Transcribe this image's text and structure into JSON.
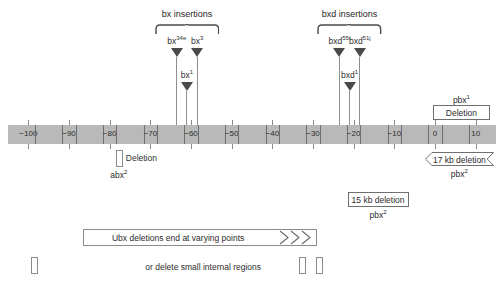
{
  "figure": {
    "type": "genomic-map-diagram",
    "axis": {
      "label_unit": "kb",
      "min": -105,
      "max": 15,
      "ticks": [
        -100,
        -90,
        -80,
        -70,
        -60,
        -50,
        -40,
        -30,
        -20,
        -10,
        0,
        10
      ],
      "tick_labels": [
        "−100",
        "−90",
        "−80",
        "−70",
        "−60",
        "−50",
        "−40",
        "−30",
        "−20",
        "−10",
        "0",
        "10"
      ],
      "bar_color": "#b9b9b9",
      "tick_color": "#6e6e6e"
    },
    "groups": [
      {
        "id": "bx-insertions",
        "title": "bx insertions",
        "brace_center_kb": -61,
        "brace_left_kb": -66,
        "brace_right_kb": -56
      },
      {
        "id": "bxd-insertions",
        "title": "bxd insertions",
        "brace_center_kb": -21,
        "brace_left_kb": -26,
        "brace_right_kb": -16
      }
    ],
    "insertions": [
      {
        "name": "bx",
        "sup": "34e",
        "label": "bx34e",
        "kb": -63.5,
        "row": "upper"
      },
      {
        "name": "bx",
        "sup": "3",
        "label": "bx3",
        "kb": -58.5,
        "row": "upper"
      },
      {
        "name": "bx",
        "sup": "1",
        "label": "bx1",
        "kb": -61.0,
        "row": "lower"
      },
      {
        "name": "bxd",
        "sup": "55i",
        "label": "bxd55i",
        "kb": -23.5,
        "row": "upper"
      },
      {
        "name": "bxd",
        "sup": "51j",
        "label": "bxd51j",
        "kb": -18.5,
        "row": "upper"
      },
      {
        "name": "bxd",
        "sup": "1",
        "label": "bxd1",
        "kb": -21.0,
        "row": "lower"
      }
    ],
    "deletions": [
      {
        "id": "pbx1-deletion",
        "shape": "box",
        "text": "Deletion",
        "allele": "pbx",
        "allele_sup": "1",
        "allele_position": "above",
        "start_kb": -0.5,
        "end_kb": 13.5
      },
      {
        "id": "abx2-deletion",
        "shape": "narrow-box",
        "text": "Deletion",
        "text_position": "right",
        "allele": "abx",
        "allele_sup": "2",
        "allele_position": "below",
        "start_kb": -78.5,
        "end_kb": -77.0
      },
      {
        "id": "pbx2-17kb-deletion",
        "shape": "double-chevron",
        "text": "17 kb deletion",
        "allele": "pbx",
        "allele_sup": "2",
        "allele_position": "below",
        "start_kb": -2.5,
        "end_kb": 14.5
      },
      {
        "id": "pbx2-15kb-deletion",
        "shape": "box",
        "text": "15 kb deletion",
        "allele": "pbx",
        "allele_sup": "2",
        "allele_position": "below",
        "start_kb": -21.5,
        "end_kb": -6.5
      }
    ],
    "ubx": {
      "bar_text": "Ubx deletions end at varying points",
      "bar_start_kb": -86.5,
      "bar_end_kb": -29.0,
      "chevron_count": 3,
      "internal_text": "or delete small internal regions",
      "internal_regions": [
        {
          "kb": -98.5
        },
        {
          "kb": -32.5
        },
        {
          "kb": -28.5
        }
      ]
    }
  }
}
